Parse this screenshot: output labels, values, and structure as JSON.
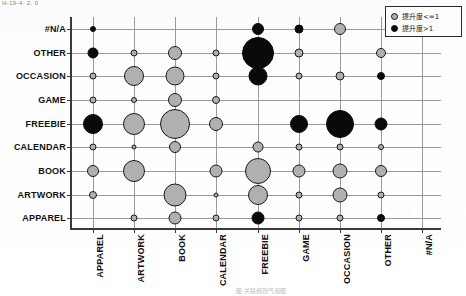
{
  "figure": {
    "top_cut_text": "H-19-4: 2. 0",
    "bottom_cut_text": "图 关联规则气泡图"
  },
  "legend": {
    "position": "top-right",
    "entries": [
      {
        "label": "提升度<=1",
        "icon": "circle-gray-icon",
        "color": "#b0b0b0"
      },
      {
        "label": "提升度>1",
        "icon": "circle-black-icon",
        "color": "#0a0a0a"
      }
    ]
  },
  "axes": {
    "y_label": "",
    "x_label": "",
    "y_categories": [
      "APPAREL",
      "ARTWORK",
      "BOOK",
      "CALENDAR",
      "FREEBIE",
      "GAME",
      "OCCASION",
      "OTHER",
      "#N/A"
    ],
    "x_categories": [
      "APPAREL",
      "ARTWORK",
      "BOOK",
      "CALENDAR",
      "FREEBIE",
      "GAME",
      "OCCASION",
      "OTHER",
      "#N/A"
    ]
  },
  "chart_data": {
    "type": "scatter",
    "title": "",
    "subtitle": "",
    "xlabel": "",
    "ylabel": "",
    "grid": true,
    "legend_position": "top-right",
    "size_encoding": "bubble area = support",
    "color_encoding": "gray = 提升度<=1 (lift<=1), black = 提升度>1 (lift>1)",
    "categories": [
      "APPAREL",
      "ARTWORK",
      "BOOK",
      "CALENDAR",
      "FREEBIE",
      "GAME",
      "OCCASION",
      "OTHER",
      "#N/A"
    ],
    "points": [
      {
        "x": "APPAREL",
        "y": "#N/A",
        "size": 3.0,
        "group": "高"
      },
      {
        "x": "APPAREL",
        "y": "OTHER",
        "size": 5.5,
        "group": "高"
      },
      {
        "x": "APPAREL",
        "y": "OCCASION",
        "size": 3.5,
        "group": "低"
      },
      {
        "x": "APPAREL",
        "y": "GAME",
        "size": 3.5,
        "group": "低"
      },
      {
        "x": "APPAREL",
        "y": "FREEBIE",
        "size": 10.0,
        "group": "高"
      },
      {
        "x": "APPAREL",
        "y": "CALENDAR",
        "size": 3.5,
        "group": "低"
      },
      {
        "x": "APPAREL",
        "y": "BOOK",
        "size": 6.0,
        "group": "低"
      },
      {
        "x": "APPAREL",
        "y": "ARTWORK",
        "size": 4.0,
        "group": "低"
      },
      {
        "x": "ARTWORK",
        "y": "OTHER",
        "size": 3.5,
        "group": "低"
      },
      {
        "x": "ARTWORK",
        "y": "OCCASION",
        "size": 10.0,
        "group": "低"
      },
      {
        "x": "ARTWORK",
        "y": "GAME",
        "size": 3.0,
        "group": "低"
      },
      {
        "x": "ARTWORK",
        "y": "FREEBIE",
        "size": 11.0,
        "group": "低"
      },
      {
        "x": "ARTWORK",
        "y": "CALENDAR",
        "size": 2.5,
        "group": "低"
      },
      {
        "x": "ARTWORK",
        "y": "BOOK",
        "size": 11.0,
        "group": "低"
      },
      {
        "x": "ARTWORK",
        "y": "APPAREL",
        "size": 3.5,
        "group": "低"
      },
      {
        "x": "BOOK",
        "y": "OTHER",
        "size": 7.0,
        "group": "低"
      },
      {
        "x": "BOOK",
        "y": "OCCASION",
        "size": 9.5,
        "group": "低"
      },
      {
        "x": "BOOK",
        "y": "GAME",
        "size": 7.0,
        "group": "低"
      },
      {
        "x": "BOOK",
        "y": "FREEBIE",
        "size": 15.0,
        "group": "低"
      },
      {
        "x": "BOOK",
        "y": "CALENDAR",
        "size": 6.0,
        "group": "低"
      },
      {
        "x": "BOOK",
        "y": "ARTWORK",
        "size": 11.5,
        "group": "低"
      },
      {
        "x": "BOOK",
        "y": "APPAREL",
        "size": 6.5,
        "group": "低"
      },
      {
        "x": "CALENDAR",
        "y": "OTHER",
        "size": 3.5,
        "group": "低"
      },
      {
        "x": "CALENDAR",
        "y": "OCCASION",
        "size": 3.5,
        "group": "低"
      },
      {
        "x": "CALENDAR",
        "y": "GAME",
        "size": 4.0,
        "group": "低"
      },
      {
        "x": "CALENDAR",
        "y": "FREEBIE",
        "size": 7.0,
        "group": "低"
      },
      {
        "x": "CALENDAR",
        "y": "BOOK",
        "size": 6.5,
        "group": "低"
      },
      {
        "x": "CALENDAR",
        "y": "ARTWORK",
        "size": 2.5,
        "group": "低"
      },
      {
        "x": "CALENDAR",
        "y": "APPAREL",
        "size": 3.5,
        "group": "低"
      },
      {
        "x": "FREEBIE",
        "y": "#N/A",
        "size": 6.0,
        "group": "高"
      },
      {
        "x": "FREEBIE",
        "y": "OTHER",
        "size": 16.0,
        "group": "高"
      },
      {
        "x": "FREEBIE",
        "y": "OCCASION",
        "size": 9.5,
        "group": "高"
      },
      {
        "x": "FREEBIE",
        "y": "CALENDAR",
        "size": 5.5,
        "group": "低"
      },
      {
        "x": "FREEBIE",
        "y": "BOOK",
        "size": 13.0,
        "group": "低"
      },
      {
        "x": "FREEBIE",
        "y": "ARTWORK",
        "size": 10.0,
        "group": "低"
      },
      {
        "x": "FREEBIE",
        "y": "APPAREL",
        "size": 6.5,
        "group": "高"
      },
      {
        "x": "GAME",
        "y": "#N/A",
        "size": 4.5,
        "group": "高"
      },
      {
        "x": "GAME",
        "y": "OTHER",
        "size": 4.5,
        "group": "低"
      },
      {
        "x": "GAME",
        "y": "OCCASION",
        "size": 3.5,
        "group": "低"
      },
      {
        "x": "GAME",
        "y": "FREEBIE",
        "size": 9.0,
        "group": "高"
      },
      {
        "x": "GAME",
        "y": "CALENDAR",
        "size": 3.5,
        "group": "低"
      },
      {
        "x": "GAME",
        "y": "BOOK",
        "size": 6.5,
        "group": "低"
      },
      {
        "x": "GAME",
        "y": "ARTWORK",
        "size": 3.5,
        "group": "低"
      },
      {
        "x": "GAME",
        "y": "APPAREL",
        "size": 3.5,
        "group": "低"
      },
      {
        "x": "OCCASION",
        "y": "#N/A",
        "size": 6.0,
        "group": "低"
      },
      {
        "x": "OCCASION",
        "y": "OCCASION",
        "size": 4.5,
        "group": "低"
      },
      {
        "x": "OCCASION",
        "y": "FREEBIE",
        "size": 14.0,
        "group": "高"
      },
      {
        "x": "OCCASION",
        "y": "CALENDAR",
        "size": 3.5,
        "group": "低"
      },
      {
        "x": "OCCASION",
        "y": "BOOK",
        "size": 7.5,
        "group": "低"
      },
      {
        "x": "OCCASION",
        "y": "ARTWORK",
        "size": 7.5,
        "group": "低"
      },
      {
        "x": "OCCASION",
        "y": "APPAREL",
        "size": 3.5,
        "group": "低"
      },
      {
        "x": "OTHER",
        "y": "OTHER",
        "size": 5.0,
        "group": "低"
      },
      {
        "x": "OTHER",
        "y": "OCCASION",
        "size": 4.0,
        "group": "高"
      },
      {
        "x": "OTHER",
        "y": "FREEBIE",
        "size": 6.5,
        "group": "高"
      },
      {
        "x": "OTHER",
        "y": "CALENDAR",
        "size": 3.0,
        "group": "低"
      },
      {
        "x": "OTHER",
        "y": "BOOK",
        "size": 6.0,
        "group": "低"
      },
      {
        "x": "OTHER",
        "y": "ARTWORK",
        "size": 3.5,
        "group": "低"
      },
      {
        "x": "OTHER",
        "y": "APPAREL",
        "size": 4.0,
        "group": "高"
      }
    ]
  }
}
